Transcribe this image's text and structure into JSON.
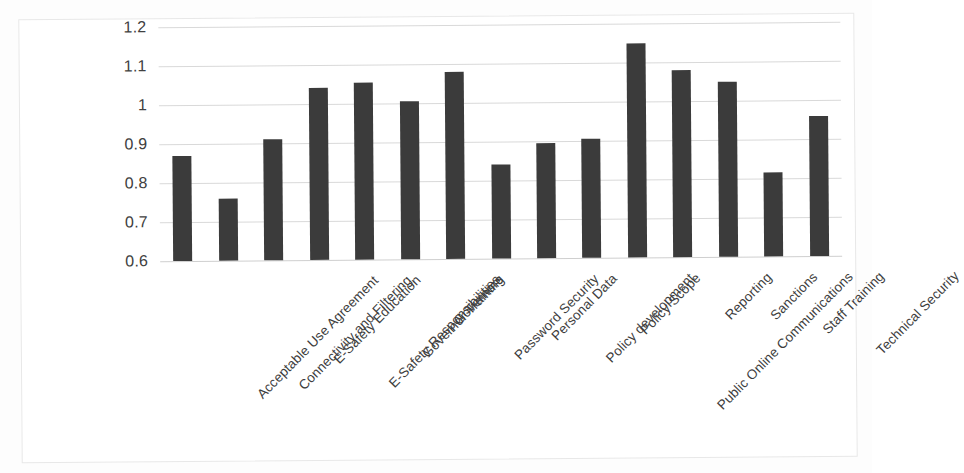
{
  "chart_data": {
    "type": "bar",
    "title": "",
    "subtitle": "",
    "xlabel": "",
    "ylabel": "",
    "ylim": [
      0.6,
      1.2
    ],
    "yticks": [
      "0.6",
      "0.7",
      "0.8",
      "0.9",
      "1",
      "1.1",
      "1.2"
    ],
    "ytick_values": [
      0.6,
      0.7,
      0.8,
      0.9,
      1.0,
      1.1,
      1.2
    ],
    "grid": true,
    "legend": "none",
    "bar_color": "#3b3b3b",
    "gridline_color": "#d9d9d9",
    "categories": [
      "Acceptable Use Agreement",
      "Connectivity and Filtering",
      "E-Safety Education",
      "E-Safety Responsibilities",
      "Governor Training",
      "Governors",
      "Password Security",
      "Personal Data",
      "Policy development",
      "Policy Scope",
      "Public Online Communications",
      "Reporting",
      "Sanctions",
      "Staff Training",
      "Technical Security"
    ],
    "values": [
      0.87,
      0.76,
      0.91,
      1.04,
      1.055,
      1.005,
      1.08,
      0.84,
      0.895,
      0.905,
      1.15,
      1.08,
      1.05,
      0.815,
      0.96
    ]
  }
}
